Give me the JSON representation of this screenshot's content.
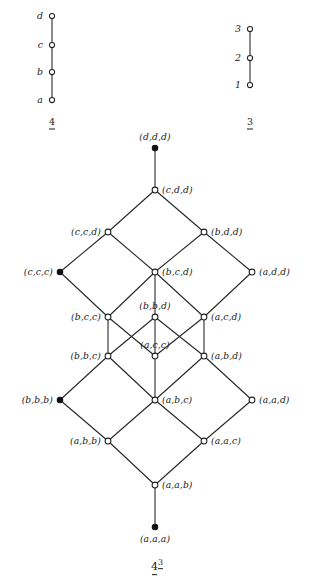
{
  "figure": {
    "caption": {
      "base": "4",
      "exponent": "3"
    }
  },
  "chart_data": {
    "type": "diagram",
    "subdiagrams": [
      {
        "name": "chain-4",
        "label_base": "4",
        "orientation": "vertical",
        "elements": [
          "a",
          "b",
          "c",
          "d"
        ],
        "cover_relations": [
          [
            "a",
            "b"
          ],
          [
            "b",
            "c"
          ],
          [
            "c",
            "d"
          ]
        ]
      },
      {
        "name": "chain-3",
        "label_base": "3",
        "orientation": "vertical",
        "elements": [
          "1",
          "2",
          "3"
        ],
        "cover_relations": [
          [
            "1",
            "2"
          ],
          [
            "2",
            "3"
          ]
        ]
      },
      {
        "name": "lattice-4-cubed",
        "label_base": "4",
        "label_exponent": "3",
        "note": "Only the labelled sublattice of the cube is drawn; filled nodes mark the diagonal elements."
      }
    ]
  },
  "chain4": {
    "label": "4",
    "nodes": [
      {
        "id": "d",
        "label": "d",
        "x": 52,
        "y": 16,
        "filled": false,
        "label_side": "left"
      },
      {
        "id": "c",
        "label": "c",
        "x": 52,
        "y": 45,
        "filled": false,
        "label_side": "left"
      },
      {
        "id": "b",
        "label": "b",
        "x": 52,
        "y": 72,
        "filled": false,
        "label_side": "left"
      },
      {
        "id": "a",
        "label": "a",
        "x": 52,
        "y": 100,
        "filled": false,
        "label_side": "left"
      }
    ],
    "edges": [
      [
        "d",
        "c"
      ],
      [
        "c",
        "b"
      ],
      [
        "b",
        "a"
      ]
    ],
    "caption_x": 52,
    "caption_y": 121
  },
  "chain3": {
    "label": "3",
    "nodes": [
      {
        "id": "n3",
        "label": "3",
        "x": 250,
        "y": 29,
        "filled": false,
        "label_side": "left"
      },
      {
        "id": "n2",
        "label": "2",
        "x": 250,
        "y": 58,
        "filled": false,
        "label_side": "left"
      },
      {
        "id": "n1",
        "label": "1",
        "x": 250,
        "y": 85,
        "filled": false,
        "label_side": "left"
      }
    ],
    "edges": [
      [
        "n3",
        "n2"
      ],
      [
        "n2",
        "n1"
      ]
    ],
    "caption_x": 250,
    "caption_y": 121
  },
  "lattice": {
    "nodes": [
      {
        "id": "ddd",
        "label": "(d,d,d)",
        "x": 155,
        "y": 148,
        "filled": true,
        "label_side": "above"
      },
      {
        "id": "cdd",
        "label": "(c,d,d)",
        "x": 155,
        "y": 190,
        "filled": false,
        "label_side": "right"
      },
      {
        "id": "ccd",
        "label": "(c,c,d)",
        "x": 108,
        "y": 232,
        "filled": false,
        "label_side": "left"
      },
      {
        "id": "bdd",
        "label": "(b,d,d)",
        "x": 204,
        "y": 232,
        "filled": false,
        "label_side": "right"
      },
      {
        "id": "ccc",
        "label": "(c,c,c)",
        "x": 60,
        "y": 272,
        "filled": true,
        "label_side": "left"
      },
      {
        "id": "bcd",
        "label": "(b,c,d)",
        "x": 155,
        "y": 272,
        "filled": false,
        "label_side": "right"
      },
      {
        "id": "add",
        "label": "(a,d,d)",
        "x": 252,
        "y": 272,
        "filled": false,
        "label_side": "right"
      },
      {
        "id": "bcc",
        "label": "(b,c,c)",
        "x": 108,
        "y": 317,
        "filled": false,
        "label_side": "left"
      },
      {
        "id": "bbd",
        "label": "(b,b,d)",
        "x": 155,
        "y": 317,
        "filled": false,
        "label_side": "above"
      },
      {
        "id": "acd",
        "label": "(a,c,d)",
        "x": 204,
        "y": 317,
        "filled": false,
        "label_side": "right"
      },
      {
        "id": "bbc",
        "label": "(b,b,c)",
        "x": 108,
        "y": 356,
        "filled": false,
        "label_side": "left"
      },
      {
        "id": "acc",
        "label": "(a,c,c)",
        "x": 155,
        "y": 356,
        "filled": false,
        "label_side": "above"
      },
      {
        "id": "abd",
        "label": "(a,b,d)",
        "x": 204,
        "y": 356,
        "filled": false,
        "label_side": "right"
      },
      {
        "id": "bbb",
        "label": "(b,b,b)",
        "x": 60,
        "y": 400,
        "filled": true,
        "label_side": "left"
      },
      {
        "id": "abc",
        "label": "(a,b,c)",
        "x": 155,
        "y": 400,
        "filled": false,
        "label_side": "right"
      },
      {
        "id": "aad",
        "label": "(a,a,d)",
        "x": 252,
        "y": 400,
        "filled": false,
        "label_side": "right"
      },
      {
        "id": "abb",
        "label": "(a,b,b)",
        "x": 108,
        "y": 441,
        "filled": false,
        "label_side": "left"
      },
      {
        "id": "aac",
        "label": "(a,a,c)",
        "x": 204,
        "y": 441,
        "filled": false,
        "label_side": "right"
      },
      {
        "id": "aab",
        "label": "(a,a,b)",
        "x": 155,
        "y": 485,
        "filled": false,
        "label_side": "right"
      },
      {
        "id": "aaa",
        "label": "(a,a,a)",
        "x": 155,
        "y": 527,
        "filled": true,
        "label_side": "below"
      }
    ],
    "edges": [
      [
        "ddd",
        "cdd"
      ],
      [
        "cdd",
        "ccd"
      ],
      [
        "cdd",
        "bdd"
      ],
      [
        "ccd",
        "ccc"
      ],
      [
        "ccd",
        "bcd"
      ],
      [
        "bdd",
        "bcd"
      ],
      [
        "bdd",
        "add"
      ],
      [
        "ccc",
        "bcc"
      ],
      [
        "bcd",
        "bcc"
      ],
      [
        "bcd",
        "bbd"
      ],
      [
        "bcd",
        "acd"
      ],
      [
        "add",
        "acd"
      ],
      [
        "bcc",
        "bbc"
      ],
      [
        "bcc",
        "acc"
      ],
      [
        "bbd",
        "bbc"
      ],
      [
        "bbd",
        "acc"
      ],
      [
        "bbd",
        "abd"
      ],
      [
        "acd",
        "acc"
      ],
      [
        "acd",
        "abd"
      ],
      [
        "bbc",
        "bbb"
      ],
      [
        "bbc",
        "abc"
      ],
      [
        "acc",
        "abc"
      ],
      [
        "abd",
        "abc"
      ],
      [
        "abd",
        "aad"
      ],
      [
        "bbb",
        "abb"
      ],
      [
        "abc",
        "abb"
      ],
      [
        "abc",
        "aac"
      ],
      [
        "aad",
        "aac"
      ],
      [
        "abb",
        "aab"
      ],
      [
        "aac",
        "aab"
      ],
      [
        "aab",
        "aaa"
      ]
    ],
    "caption_x": 157,
    "caption_y": 566
  }
}
